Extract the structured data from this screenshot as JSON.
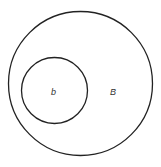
{
  "diagram": {
    "type": "nested-sets",
    "outer_set": {
      "label": "B",
      "cx": 80.5,
      "cy": 83.5,
      "r": 72
    },
    "inner_set": {
      "label": "b",
      "cx": 54.5,
      "cy": 90.5,
      "r": 33
    },
    "stroke_color": "#222222"
  }
}
